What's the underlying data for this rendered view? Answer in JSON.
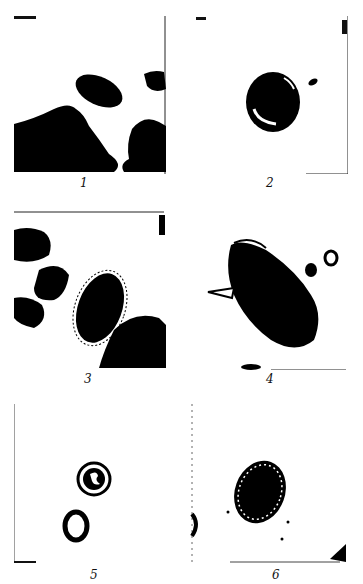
{
  "figure": {
    "panels": [
      {
        "number": "1",
        "content": "elongated oval dark egg above large dark debris masses"
      },
      {
        "number": "2",
        "content": "round dark egg with light crescent highlight"
      },
      {
        "number": "3",
        "content": "dark oval egg with thin outer shell surrounded by dark debris"
      },
      {
        "number": "4",
        "content": "large spindle-shaped dark egg with lateral spine, small round cells nearby"
      },
      {
        "number": "5",
        "content": "round egg with double outline and inner figure, small ring-shaped cell below"
      },
      {
        "number": "6",
        "content": "oval dark egg with light granular border"
      }
    ],
    "colors": {
      "ink": "#000000",
      "paper": "#ffffff"
    }
  }
}
